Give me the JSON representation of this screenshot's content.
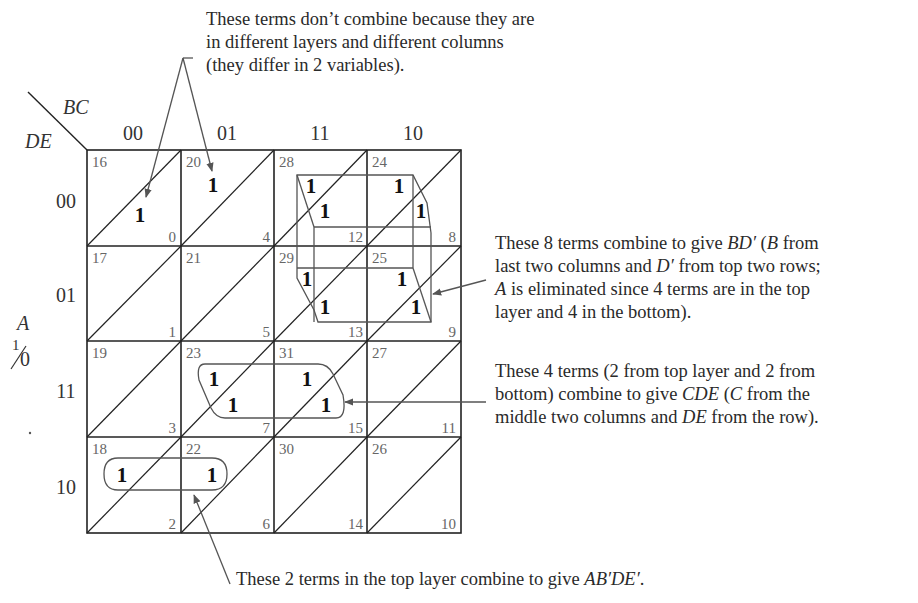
{
  "map": {
    "row_var": "DE",
    "col_var": "BC",
    "layer_var": "A",
    "layer_top": "1",
    "layer_bottom": "0",
    "col_labels": [
      "00",
      "01",
      "11",
      "10"
    ],
    "row_labels": [
      "00",
      "01",
      "11",
      "10"
    ],
    "cells": [
      [
        {
          "top": "16",
          "bottom": "0"
        },
        {
          "top": "20",
          "bottom": "4"
        },
        {
          "top": "28",
          "bottom": "12"
        },
        {
          "top": "24",
          "bottom": "8"
        }
      ],
      [
        {
          "top": "17",
          "bottom": "1"
        },
        {
          "top": "21",
          "bottom": "5"
        },
        {
          "top": "29",
          "bottom": "13"
        },
        {
          "top": "25",
          "bottom": "9"
        }
      ],
      [
        {
          "top": "19",
          "bottom": "3"
        },
        {
          "top": "23",
          "bottom": "7"
        },
        {
          "top": "31",
          "bottom": "15"
        },
        {
          "top": "27",
          "bottom": "11"
        }
      ],
      [
        {
          "top": "18",
          "bottom": "2"
        },
        {
          "top": "22",
          "bottom": "6"
        },
        {
          "top": "30",
          "bottom": "14"
        },
        {
          "top": "26",
          "bottom": "10"
        }
      ]
    ],
    "ones": [
      {
        "minterm": "0",
        "layer": "bottom"
      },
      {
        "minterm": "20",
        "layer": "top"
      },
      {
        "minterm": "28",
        "layer": "top"
      },
      {
        "minterm": "12",
        "layer": "bottom"
      },
      {
        "minterm": "24",
        "layer": "top"
      },
      {
        "minterm": "8",
        "layer": "bottom"
      },
      {
        "minterm": "29",
        "layer": "top"
      },
      {
        "minterm": "13",
        "layer": "bottom"
      },
      {
        "minterm": "25",
        "layer": "top"
      },
      {
        "minterm": "9",
        "layer": "bottom"
      },
      {
        "minterm": "23",
        "layer": "top"
      },
      {
        "minterm": "7",
        "layer": "bottom"
      },
      {
        "minterm": "31",
        "layer": "top"
      },
      {
        "minterm": "15",
        "layer": "bottom"
      },
      {
        "minterm": "18",
        "layer": "top"
      },
      {
        "minterm": "22",
        "layer": "top"
      }
    ],
    "one_label": "1"
  },
  "annotations": {
    "no_combine": [
      "These terms don’t combine because they are",
      "in different layers and different columns",
      "(they differ in 2 variables)."
    ],
    "bd_prime": {
      "line1_pre": "These 8 terms combine to give ",
      "line1_expr": "BD′",
      "line1_post": " (",
      "line1_B": "B",
      "line1_end": " from",
      "line2_pre": "last two columns and ",
      "line2_expr": "D′",
      "line2_post": " from top two rows;",
      "line3_var": "A",
      "line3_post": " is eliminated since 4 terms are in the top",
      "line4": "layer and 4 in the bottom)."
    },
    "cde": {
      "line1": "These 4 terms (2 from top layer and 2 from",
      "line2_pre": "bottom) combine to give ",
      "line2_expr": "CDE",
      "line2_mid": " (",
      "line2_C": "C",
      "line2_post": " from the",
      "line3_pre": "middle two columns and ",
      "line3_expr": "DE",
      "line3_post": " from the row)."
    },
    "ab_de": {
      "pre": "These 2 terms in the top layer combine to give ",
      "expr": "AB′DE′",
      "post": "."
    }
  }
}
